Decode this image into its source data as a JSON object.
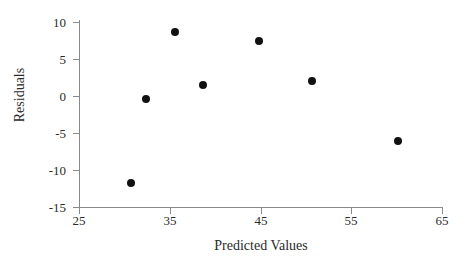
{
  "chart_data": {
    "type": "scatter",
    "title": "",
    "xlabel": "Predicted Values",
    "ylabel": "Residuals",
    "xlim": [
      25,
      65
    ],
    "ylim": [
      -15,
      10
    ],
    "xticks": [
      25,
      35,
      45,
      55,
      65
    ],
    "yticks": [
      10,
      5,
      0,
      -5,
      -10,
      -15
    ],
    "xtick_labels": [
      "25",
      "35",
      "45",
      "55",
      "65"
    ],
    "ytick_labels": [
      "10",
      "5",
      "0",
      "-5",
      "-10",
      "-15"
    ],
    "grid": false,
    "legend": false,
    "marker": "filled-circle",
    "marker_color": "#111111",
    "axis_color": "#8a8a8a",
    "background": "#ffffff",
    "points": [
      {
        "x": 30.7,
        "y": -11.8
      },
      {
        "x": 32.4,
        "y": -0.4
      },
      {
        "x": 35.6,
        "y": 8.6
      },
      {
        "x": 38.7,
        "y": 1.5
      },
      {
        "x": 44.8,
        "y": 7.4
      },
      {
        "x": 50.7,
        "y": 2.1
      },
      {
        "x": 60.2,
        "y": -6.1
      }
    ]
  }
}
